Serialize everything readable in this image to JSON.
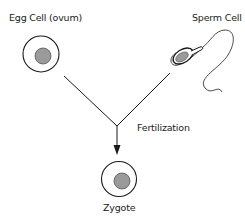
{
  "diagram": {
    "title": "Fertilization",
    "nodes": [
      {
        "id": "egg",
        "label": "Egg Cell (ovum)"
      },
      {
        "id": "sperm",
        "label": "Sperm Cell"
      },
      {
        "id": "zygote",
        "label": "Zygote"
      }
    ],
    "edges": [
      {
        "from": "egg",
        "to": "zygote",
        "label": "Fertilization"
      },
      {
        "from": "sperm",
        "to": "zygote",
        "label": "Fertilization"
      }
    ],
    "process_label": "Fertilization"
  },
  "colors": {
    "stroke": "#1a1a1a",
    "nucleus_fill": "#9a9a9a",
    "background": "#ffffff"
  }
}
